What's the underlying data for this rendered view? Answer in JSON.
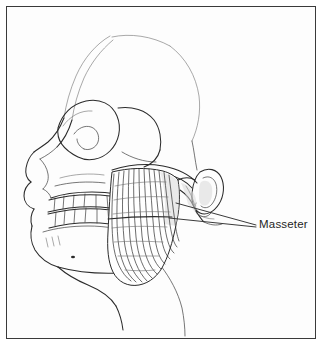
{
  "figure": {
    "kind": "anatomical-line-drawing",
    "view": "lateral-skull-left",
    "title": "Masseter",
    "background_color": "#fdfdfd",
    "ink_color": "#2b2b2b",
    "frame": {
      "visible": true,
      "color": "#3a3a3a",
      "inset_px": 6,
      "thickness_px": 1.6
    }
  },
  "labels": [
    {
      "id": "masseter",
      "text": "Masseter",
      "color": "#1f1f1f",
      "x": 259,
      "y": 218,
      "leader_lines": 2
    }
  ],
  "structures": [
    {
      "id": "cranium",
      "name": "Cranial vault",
      "labeled": false
    },
    {
      "id": "frontal-bone",
      "name": "Frontal bone",
      "labeled": false
    },
    {
      "id": "nasal-bone",
      "name": "Nasal bone",
      "labeled": false
    },
    {
      "id": "orbit",
      "name": "Orbit / eye socket",
      "labeled": false
    },
    {
      "id": "zygomatic-arch",
      "name": "Zygomatic arch",
      "labeled": false
    },
    {
      "id": "maxilla",
      "name": "Maxilla",
      "labeled": false
    },
    {
      "id": "upper-teeth",
      "name": "Maxillary dental arch",
      "labeled": false
    },
    {
      "id": "lower-teeth",
      "name": "Mandibular dental arch",
      "labeled": false
    },
    {
      "id": "mandible",
      "name": "Mandible",
      "labeled": false
    },
    {
      "id": "mental-foramen",
      "name": "Mental foramen",
      "labeled": false
    },
    {
      "id": "masseter-muscle",
      "name": "Masseter muscle",
      "labeled": true
    },
    {
      "id": "external-ear",
      "name": "External ear / auricle",
      "labeled": false
    },
    {
      "id": "mastoid-process",
      "name": "Mastoid process",
      "labeled": false
    },
    {
      "id": "neck-contour",
      "name": "Neck and throat contour",
      "labeled": false
    }
  ]
}
